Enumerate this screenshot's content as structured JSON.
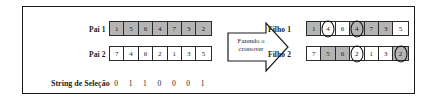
{
  "figure": {
    "arrow": {
      "line1": "Fazendo o",
      "line2": "crossover",
      "icon": "right-arrow-icon"
    },
    "selection_string": {
      "label": "String de Seleção",
      "bits": [
        "0",
        "1",
        "1",
        "0",
        "0",
        "0",
        "1"
      ]
    },
    "parents": [
      {
        "label": "Pai 1",
        "genes": [
          {
            "value": "1",
            "shaded": true,
            "circled": false
          },
          {
            "value": "5",
            "shaded": true,
            "circled": false
          },
          {
            "value": "6",
            "shaded": true,
            "circled": false
          },
          {
            "value": "4",
            "shaded": true,
            "circled": false
          },
          {
            "value": "7",
            "shaded": true,
            "circled": false
          },
          {
            "value": "3",
            "shaded": true,
            "circled": false
          },
          {
            "value": "2",
            "shaded": true,
            "circled": false
          }
        ]
      },
      {
        "label": "Pai 2",
        "genes": [
          {
            "value": "7",
            "shaded": false,
            "circled": false
          },
          {
            "value": "4",
            "shaded": false,
            "circled": false
          },
          {
            "value": "6",
            "shaded": false,
            "circled": false
          },
          {
            "value": "2",
            "shaded": false,
            "circled": false
          },
          {
            "value": "1",
            "shaded": false,
            "circled": false
          },
          {
            "value": "3",
            "shaded": false,
            "circled": false
          },
          {
            "value": "5",
            "shaded": false,
            "circled": false
          }
        ]
      }
    ],
    "children": [
      {
        "label": "Filho 1",
        "genes": [
          {
            "value": "1",
            "shaded": true,
            "circled": false
          },
          {
            "value": "4",
            "shaded": false,
            "circled": true
          },
          {
            "value": "6",
            "shaded": false,
            "circled": false
          },
          {
            "value": "4",
            "shaded": true,
            "circled": true
          },
          {
            "value": "7",
            "shaded": true,
            "circled": false
          },
          {
            "value": "3",
            "shaded": true,
            "circled": false
          },
          {
            "value": "5",
            "shaded": false,
            "circled": false
          }
        ]
      },
      {
        "label": "Filho 2",
        "genes": [
          {
            "value": "7",
            "shaded": false,
            "circled": false
          },
          {
            "value": "5",
            "shaded": true,
            "circled": false
          },
          {
            "value": "6",
            "shaded": true,
            "circled": false
          },
          {
            "value": "2",
            "shaded": false,
            "circled": true
          },
          {
            "value": "1",
            "shaded": false,
            "circled": false
          },
          {
            "value": "3",
            "shaded": false,
            "circled": false
          },
          {
            "value": "2",
            "shaded": true,
            "circled": true
          }
        ]
      }
    ],
    "colors": {
      "shaded": "#b4b4b4",
      "unshaded": "#ffffff",
      "border": "#2b2b2b",
      "circle": "#0d0d0d"
    }
  }
}
